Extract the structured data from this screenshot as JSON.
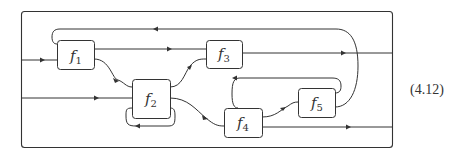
{
  "diagram": {
    "boxes": [
      {
        "id": "f1",
        "letter": "f",
        "sub": "1"
      },
      {
        "id": "f2",
        "letter": "f",
        "sub": "2"
      },
      {
        "id": "f3",
        "letter": "f",
        "sub": "3"
      },
      {
        "id": "f4",
        "letter": "f",
        "sub": "4"
      },
      {
        "id": "f5",
        "letter": "f",
        "sub": "5"
      }
    ],
    "equation_number": "(4.12)",
    "stroke_color": "#333333",
    "background": "#ffffff"
  }
}
